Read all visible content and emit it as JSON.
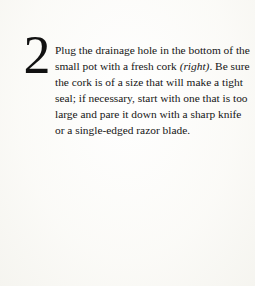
{
  "page": {
    "background_color": "#fcfcfa",
    "text_color": "#151515"
  },
  "step": {
    "number": "2",
    "text_before_italic": "Plug the drainage hole in the bottom of the small pot with a fresh cork ",
    "italic_note": "(right)",
    "text_after_italic": ". Be sure the cork is of a size that will make a tight seal; if necessary, start with one that is too large and pare it down with a sharp knife or a single-edged razor blade.",
    "lines": [
      "Plug the drainage hole in the bottom of the",
      "small pot with a fresh cork (right). Be sure",
      "the cork is of a size that will make a tight",
      "seal; if necessary, start with one that is too",
      "large and pare it down with a sharp knife or",
      "a single-edged razor blade."
    ]
  }
}
